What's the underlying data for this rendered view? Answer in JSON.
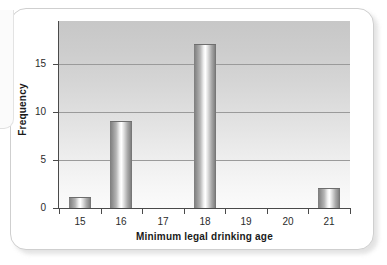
{
  "figure": {
    "kind": "histogram-card",
    "frame_color": "#cfcfcf",
    "background": "#ffffff"
  },
  "chart_data": {
    "type": "bar",
    "title": "",
    "xlabel": "Minimum legal drinking age",
    "ylabel": "Frequency",
    "categories": [
      "15",
      "16",
      "17",
      "18",
      "19",
      "20",
      "21"
    ],
    "values": [
      1,
      9,
      0,
      17,
      0,
      0,
      2
    ],
    "ylim": [
      0,
      19.5
    ],
    "yticks": [
      "0",
      "5",
      "10",
      "15"
    ],
    "ytick_values": [
      0,
      5,
      10,
      15
    ],
    "xticks": [
      "15",
      "16",
      "17",
      "18",
      "19",
      "20",
      "21"
    ],
    "grid": "horizontal",
    "legend": "none",
    "bar_style": "cylindrical-gradient",
    "plot_bg_top": "#c7c7c7",
    "plot_bg_bottom": "#fbfbfb",
    "bar_color": "#a8a8a8",
    "axis_color": "#4a4a4a",
    "gridline_color": "#9a9a9a"
  }
}
